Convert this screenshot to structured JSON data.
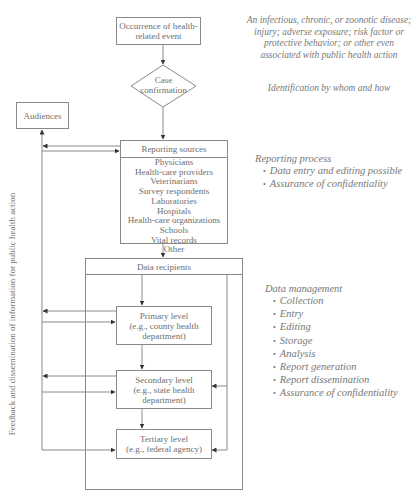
{
  "diagram": {
    "nodes": {
      "occurrence": {
        "lines": [
          "Occurrence of health-",
          "related event"
        ]
      },
      "case_confirmation": {
        "lines": [
          "Case",
          "confirmation"
        ]
      },
      "audiences": {
        "label": "Audiences"
      },
      "reporting_sources": {
        "title": "Reporting sources",
        "items": [
          "Physicians",
          "Health-care providers",
          "Veterinarians",
          "Survey respondents",
          "Laboratories",
          "Hospitals",
          "Health-care organizations",
          "Schools",
          "Vital records",
          "Other"
        ]
      },
      "data_recipients": {
        "title": "Data recipients"
      },
      "primary_level": {
        "lines": [
          "Primary level",
          "(e.g., county health",
          "department)"
        ]
      },
      "secondary_level": {
        "lines": [
          "Secondary level",
          "(e.g., state health",
          "department)"
        ]
      },
      "tertiary_level": {
        "lines": [
          "Tertiary level",
          "(e.g., federal agency)"
        ]
      }
    },
    "side_label": "Feedback and dissemination of information for public health action",
    "annotations": {
      "event_description": [
        "An infectious, chronic, or zoonotic disease;",
        "injury; adverse exposure; risk factor or",
        "protective behavior; or other even",
        "associated with public health action"
      ],
      "identification": "Identification by whom and how",
      "reporting_process": {
        "title": "Reporting process",
        "items": [
          "Data entry and editing possible",
          "Assurance of confidentiality"
        ]
      },
      "data_management": {
        "title": "Data management",
        "items": [
          "Collection",
          "Entry",
          "Editing",
          "Storage",
          "Analysis",
          "Report generation",
          "Report dissemination",
          "Assurance of confidentiality"
        ]
      }
    },
    "bullet_glyph": "•",
    "colors": {
      "line": "#8a8a8a",
      "arrow": "#333333",
      "text": "#6e6e6e"
    }
  }
}
